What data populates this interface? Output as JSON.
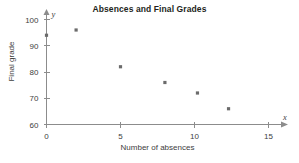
{
  "chart_data": {
    "type": "scatter",
    "title": "Absences and Final Grades",
    "xlabel": "Number of absences",
    "ylabel": "Final grade",
    "xlim": [
      0,
      15
    ],
    "ylim": [
      60,
      100
    ],
    "xticks": [
      0,
      5,
      10,
      15
    ],
    "yticks": [
      60,
      70,
      80,
      90,
      100
    ],
    "xtick_labels": [
      "0",
      "5",
      "10",
      "15"
    ],
    "ytick_labels": [
      "60",
      "70",
      "80",
      "90",
      "100"
    ],
    "grid": false,
    "legend": false,
    "x_axis_symbol": "x",
    "y_axis_symbol": "y",
    "marker_color": "#6b6b6b",
    "axis_color": "#8c8c8c",
    "title_color": "#231f20",
    "points": [
      {
        "x": 0,
        "y": 94
      },
      {
        "x": 2,
        "y": 96
      },
      {
        "x": 5,
        "y": 82
      },
      {
        "x": 8,
        "y": 76
      },
      {
        "x": 10.2,
        "y": 72
      },
      {
        "x": 12.3,
        "y": 66
      }
    ],
    "x": [
      0,
      2,
      5,
      8,
      10.2,
      12.3
    ],
    "values": [
      94,
      96,
      82,
      76,
      72,
      66
    ]
  }
}
